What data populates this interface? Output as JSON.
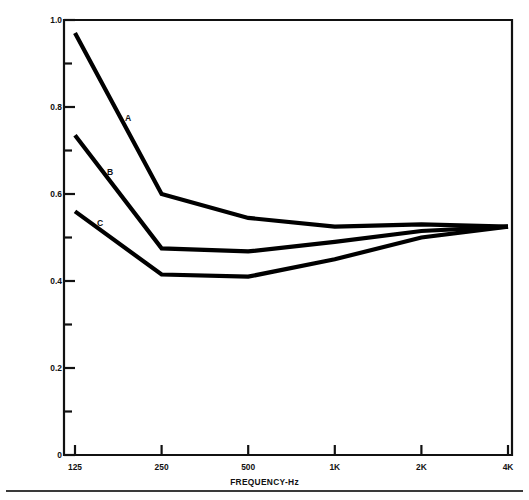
{
  "chart_data": {
    "type": "line",
    "title": "",
    "xlabel": "FREQUENCY-Hz",
    "ylabel": "REVERBERATION TIME SEC.",
    "x": [
      "125",
      "250",
      "500",
      "1K",
      "2K",
      "4K"
    ],
    "xtick_labels": [
      "125",
      "250",
      "500",
      "1K",
      "2K",
      "4K"
    ],
    "ytick_labels": [
      "0",
      "0.2",
      "0.4",
      "0.6",
      "0.8",
      "1.0"
    ],
    "ytick_values": [
      0,
      0.2,
      0.4,
      0.6,
      0.8,
      1.0
    ],
    "yminor_values": [
      0.1,
      0.3,
      0.5,
      0.7,
      0.9
    ],
    "ylim": [
      0,
      1.0
    ],
    "grid": false,
    "legend_position": "inline-curve-labels",
    "line_color": "#000000",
    "series": [
      {
        "name": "A",
        "label": "A",
        "values": [
          0.97,
          0.6,
          0.545,
          0.525,
          0.53,
          0.525
        ]
      },
      {
        "name": "B",
        "label": "B",
        "values": [
          0.735,
          0.475,
          0.468,
          0.49,
          0.515,
          0.525
        ]
      },
      {
        "name": "C",
        "label": "C",
        "values": [
          0.56,
          0.415,
          0.41,
          0.45,
          0.5,
          0.525
        ]
      }
    ],
    "annotations": [
      {
        "text": "A",
        "x_px": 128,
        "y_px": 118
      },
      {
        "text": "B",
        "x_px": 110,
        "y_px": 172
      },
      {
        "text": "C",
        "x_px": 100,
        "y_px": 223
      }
    ]
  }
}
